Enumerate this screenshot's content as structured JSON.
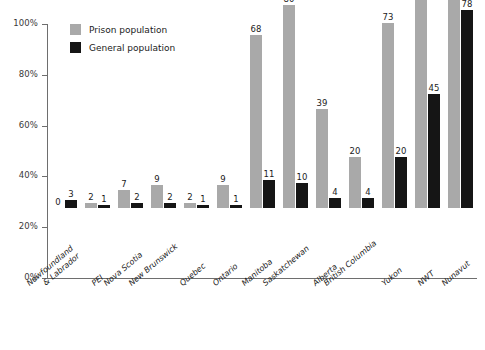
{
  "chart_data": {
    "type": "bar",
    "title": "",
    "subtitle": "",
    "xlabel": "",
    "ylabel": "",
    "ylim": [
      0,
      100
    ],
    "yticks": [
      "0%",
      "20%",
      "40%",
      "60%",
      "80%",
      "100%"
    ],
    "ytick_values": [
      0,
      20,
      40,
      60,
      80,
      100
    ],
    "grid": false,
    "legend_position": "top-left",
    "value_labels": true,
    "categories": [
      "Newfoundland & Labrador",
      "PEI",
      "Nova Scotia",
      "New Brunswick",
      "Quebec",
      "Ontario",
      "Manitoba",
      "Saskatchewan",
      "Alberta",
      "British Columbia",
      "Yukon",
      "NWT",
      "Nunavut"
    ],
    "categories_display": [
      [
        "Newfoundland",
        "& Labrador"
      ],
      [
        "PEI"
      ],
      [
        "Nova Scotia"
      ],
      [
        "New Brunswick"
      ],
      [
        "Quebec"
      ],
      [
        "Ontario"
      ],
      [
        "Manitoba"
      ],
      [
        "Saskatchewan"
      ],
      [
        "Alberta"
      ],
      [
        "British Columbia"
      ],
      [
        "Yukon"
      ],
      [
        "NWT"
      ],
      [
        "Nunavut"
      ]
    ],
    "series": [
      {
        "name": "Prison population",
        "color": "#a9a9a9",
        "values": [
          0,
          2,
          7,
          9,
          2,
          9,
          68,
          80,
          39,
          20,
          73,
          88,
          97
        ]
      },
      {
        "name": "General population",
        "color": "#151515",
        "values": [
          3,
          1,
          2,
          2,
          1,
          1,
          11,
          10,
          4,
          4,
          20,
          45,
          78
        ]
      }
    ]
  },
  "legend": {
    "items": [
      {
        "label": "Prison population",
        "color": "#a9a9a9"
      },
      {
        "label": "General population",
        "color": "#151515"
      }
    ]
  },
  "colors": {
    "prison": "#a9a9a9",
    "general": "#151515",
    "axis": "#6e6e6e",
    "text": "#1b1b1b",
    "background": "#ffffff"
  }
}
